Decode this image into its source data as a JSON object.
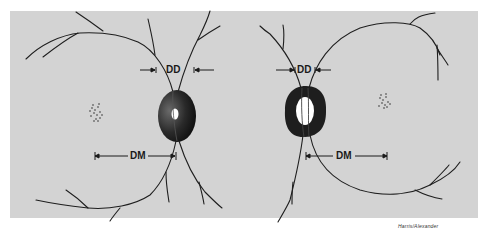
{
  "figure": {
    "background_color": "#d3d3d3",
    "vessel_color": "#1e1e1e",
    "left_eye": {
      "dd_label": "DD",
      "dm_label": "DM",
      "description": "optic disc (small cup) with macula to the left"
    },
    "right_eye": {
      "dd_label": "DD",
      "dm_label": "DM",
      "description": "optic disc (large cup) with macula to the right"
    },
    "credit": "Harris/Alexander"
  }
}
